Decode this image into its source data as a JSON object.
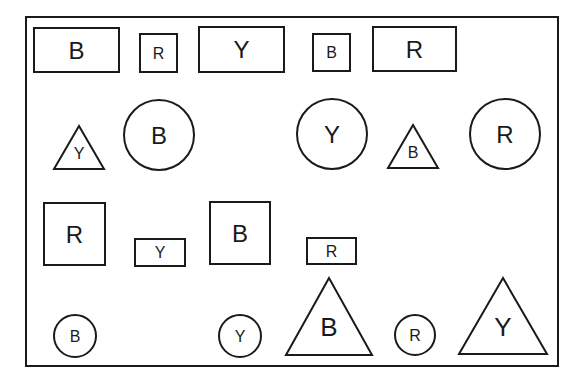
{
  "diagram": {
    "frame": {
      "x": 26,
      "y": 17,
      "w": 532,
      "h": 349
    },
    "shapes": [
      {
        "type": "rect",
        "label": "B",
        "x": 34,
        "y": 28,
        "w": 85,
        "h": 44,
        "font": 24
      },
      {
        "type": "rect",
        "label": "R",
        "x": 140,
        "y": 34,
        "w": 37,
        "h": 38,
        "font": 16
      },
      {
        "type": "rect",
        "label": "Y",
        "x": 199,
        "y": 27,
        "w": 85,
        "h": 45,
        "font": 24
      },
      {
        "type": "rect",
        "label": "B",
        "x": 313,
        "y": 34,
        "w": 37,
        "h": 37,
        "font": 16
      },
      {
        "type": "rect",
        "label": "R",
        "x": 373,
        "y": 27,
        "w": 83,
        "h": 44,
        "font": 24
      },
      {
        "type": "triangle",
        "label": "Y",
        "cx": 79,
        "top": 126,
        "bottom": 169,
        "half": 25,
        "font": 16
      },
      {
        "type": "circle",
        "label": "B",
        "cx": 159,
        "cy": 135,
        "r": 35,
        "font": 24
      },
      {
        "type": "circle",
        "label": "Y",
        "cx": 332,
        "cy": 134,
        "r": 35,
        "font": 24
      },
      {
        "type": "triangle",
        "label": "B",
        "cx": 413,
        "top": 125,
        "bottom": 168,
        "half": 25,
        "font": 16
      },
      {
        "type": "circle",
        "label": "R",
        "cx": 505,
        "cy": 134,
        "r": 35,
        "font": 24
      },
      {
        "type": "rect",
        "label": "R",
        "x": 44,
        "y": 203,
        "w": 61,
        "h": 62,
        "font": 24
      },
      {
        "type": "rect",
        "label": "Y",
        "x": 135,
        "y": 239,
        "w": 50,
        "h": 27,
        "font": 16
      },
      {
        "type": "rect",
        "label": "B",
        "x": 210,
        "y": 202,
        "w": 60,
        "h": 62,
        "font": 24
      },
      {
        "type": "rect",
        "label": "R",
        "x": 307,
        "y": 238,
        "w": 49,
        "h": 26,
        "font": 16
      },
      {
        "type": "circle",
        "label": "B",
        "cx": 75,
        "cy": 336,
        "r": 21,
        "font": 16
      },
      {
        "type": "circle",
        "label": "Y",
        "cx": 240,
        "cy": 336,
        "r": 21,
        "font": 16
      },
      {
        "type": "triangle",
        "label": "B",
        "cx": 329,
        "top": 278,
        "bottom": 355,
        "half": 43,
        "font": 26
      },
      {
        "type": "circle",
        "label": "R",
        "cx": 415,
        "cy": 335,
        "r": 20,
        "font": 16
      },
      {
        "type": "triangle",
        "label": "Y",
        "cx": 503,
        "top": 278,
        "bottom": 354,
        "half": 44,
        "font": 26
      }
    ]
  }
}
